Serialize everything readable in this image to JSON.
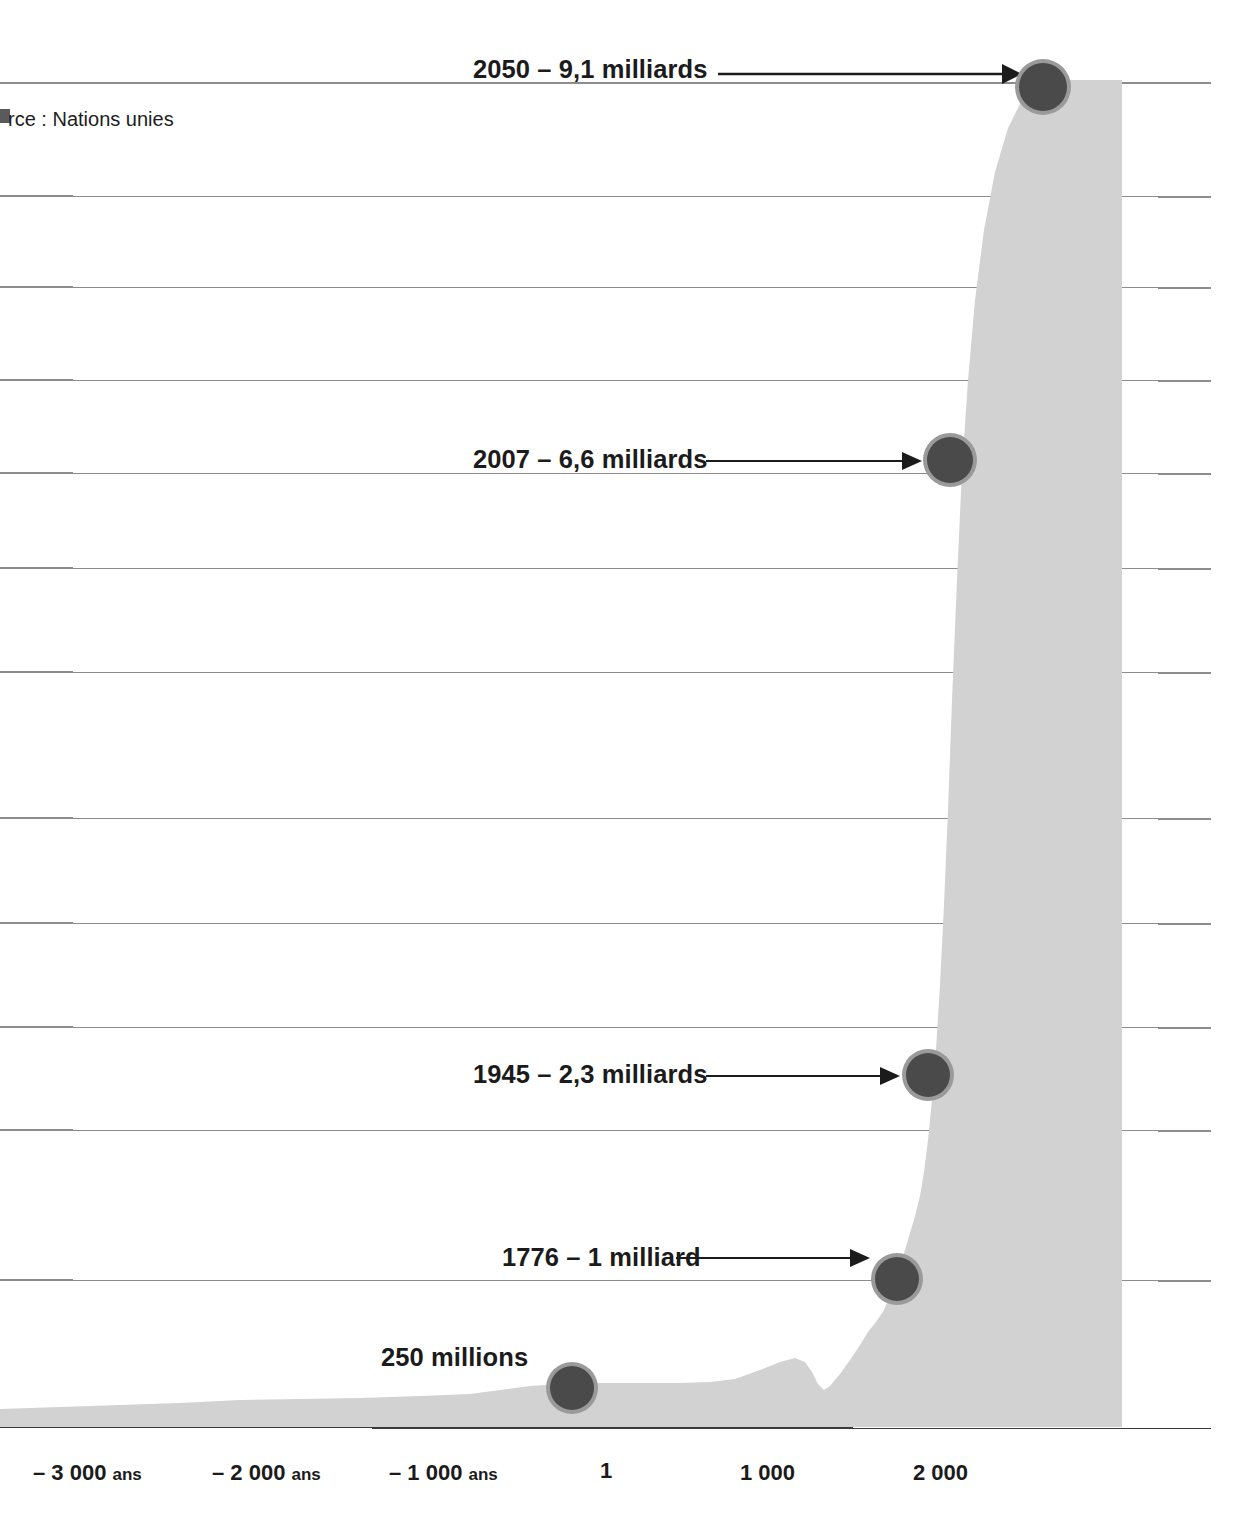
{
  "figure": {
    "source_note": "rce : Nations unies",
    "background_color": "#ffffff",
    "area_fill_color": "#d2d2d2",
    "gridline_color": "#8c8c8c",
    "marker_ring_color": "#8f8f8f",
    "marker_core_color": "#4a4a4a",
    "text_color": "#1b1b1b"
  },
  "chart_data": {
    "type": "area",
    "title": "",
    "subtitle": "",
    "xlabel": "",
    "ylabel": "",
    "grid": true,
    "legend_position": "none",
    "xlim": [
      -3600,
      2400
    ],
    "ylim": [
      0,
      10
    ],
    "x_tick_labels": [
      "– 3 000 ans",
      "– 2 000 ans",
      "– 1 000 ans",
      "1",
      "1 000",
      "2 000"
    ],
    "x_tick_values": [
      -3000,
      -2000,
      -1000,
      1,
      1000,
      2000
    ],
    "x_tick_units": [
      "ans",
      "ans",
      "ans",
      "",
      "",
      ""
    ],
    "y_gridline_count": 13,
    "series": [
      {
        "name": "Population mondiale",
        "unit": "milliards",
        "x": [
          -3600,
          -3300,
          -3000,
          -2700,
          -2400,
          -2100,
          -1800,
          -1600,
          -1400,
          -1200,
          -1000,
          -800,
          -600,
          -400,
          -200,
          1,
          200,
          400,
          600,
          800,
          1000,
          1100,
          1200,
          1300,
          1340,
          1400,
          1450,
          1500,
          1600,
          1700,
          1750,
          1776,
          1800,
          1850,
          1900,
          1930,
          1945,
          1960,
          1975,
          1990,
          2000,
          2007,
          2020,
          2035,
          2050
        ],
        "y": [
          0.05,
          0.06,
          0.07,
          0.08,
          0.09,
          0.1,
          0.11,
          0.12,
          0.13,
          0.15,
          0.17,
          0.19,
          0.2,
          0.21,
          0.23,
          0.25,
          0.25,
          0.25,
          0.25,
          0.26,
          0.31,
          0.34,
          0.38,
          0.42,
          0.44,
          0.35,
          0.37,
          0.44,
          0.56,
          0.65,
          0.77,
          1.0,
          1.06,
          1.26,
          1.65,
          2.07,
          2.3,
          3.03,
          4.07,
          5.3,
          6.12,
          6.6,
          7.8,
          8.6,
          9.1
        ]
      }
    ],
    "annotations": [
      {
        "id": "a2050",
        "label": "2050 – 9,1 milliards",
        "year": 2050,
        "value": 9.1,
        "unit": "milliards",
        "has_arrow": true
      },
      {
        "id": "a2007",
        "label": "2007 – 6,6 milliards",
        "year": 2007,
        "value": 6.6,
        "unit": "milliards",
        "has_arrow": true
      },
      {
        "id": "a1945",
        "label": "1945 – 2,3 milliards",
        "year": 1945,
        "value": 2.3,
        "unit": "milliards",
        "has_arrow": true
      },
      {
        "id": "a1776",
        "label": "1776 – 1 milliard",
        "year": 1776,
        "value": 1.0,
        "unit": "milliard",
        "has_arrow": true
      },
      {
        "id": "a250m",
        "label": "250 millions",
        "year": 1,
        "value": 0.25,
        "unit": "millions",
        "has_arrow": false
      }
    ]
  }
}
